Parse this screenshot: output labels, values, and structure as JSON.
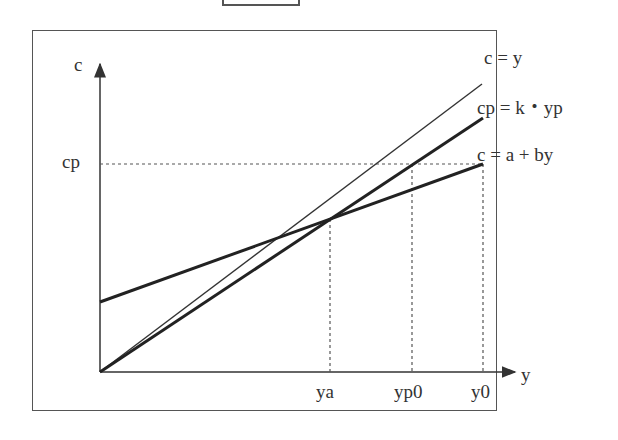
{
  "figure": {
    "y_axis_label": "c",
    "x_axis_label": "y",
    "y_tick_label": "cp",
    "x_tick_labels": [
      "ya",
      "yp0",
      "y0"
    ],
    "line_labels": {
      "c_eq_y": "c = y",
      "cp_eq_kyp": "cp = k・yp",
      "c_eq_a_by": "c = a + by"
    }
  },
  "colors": {
    "line": "#333333",
    "frame": "#555555",
    "guide": "#555555"
  }
}
